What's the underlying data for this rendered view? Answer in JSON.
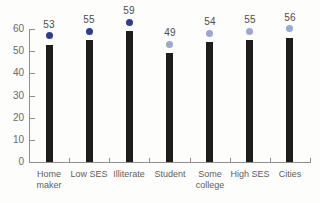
{
  "chart_data": {
    "type": "bar",
    "title": "",
    "xlabel": "",
    "ylabel": "",
    "categories": [
      "Home maker",
      "Low SES",
      "Illiterate",
      "Student",
      "Some college",
      "High SES",
      "Cities"
    ],
    "values": [
      53,
      55,
      59,
      49,
      54,
      55,
      56
    ],
    "value_labels": [
      "53",
      "55",
      "59",
      "49",
      "54",
      "55",
      "56"
    ],
    "dot_colors": [
      "#2c3b96",
      "#2c3b96",
      "#2c3b96",
      "#9ea6d4",
      "#9ea6d4",
      "#9ea6d4",
      "#9ea6d4"
    ],
    "ylim": [
      0,
      60
    ],
    "yticks": [
      0,
      10,
      20,
      30,
      40,
      50,
      60
    ],
    "grid": false,
    "legend": null,
    "bar_color": "#1e1d1b",
    "colors": {
      "bar": "#1e1d1b",
      "dot_dark": "#2c3b96",
      "dot_light": "#9ea6d4",
      "axis": "#8e8e8e",
      "value_label_text": "#4c4c4c",
      "tick_label_text": "#6a6a6a",
      "category_label_text": "#5d5d5d",
      "background": "#fdfdfb"
    }
  }
}
